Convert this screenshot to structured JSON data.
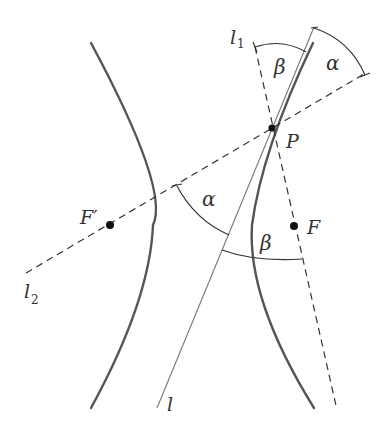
{
  "figure": {
    "type": "hyperbola reflection property diagram",
    "labels": {
      "line_l1": "l",
      "line_l1_sub": "1",
      "line_l2": "l",
      "line_l2_sub": "2",
      "tangent_l": "l",
      "point_P": "P",
      "focus_F": "F",
      "focus_F_prime": "F′",
      "angle_alpha_top": "α",
      "angle_beta_top": "β",
      "angle_alpha_bottom": "α",
      "angle_beta_bottom": "β"
    },
    "colors": {
      "hyperbola": "#555555",
      "tangent": "#777777",
      "dashed": "#333333",
      "points": "#111111"
    }
  }
}
